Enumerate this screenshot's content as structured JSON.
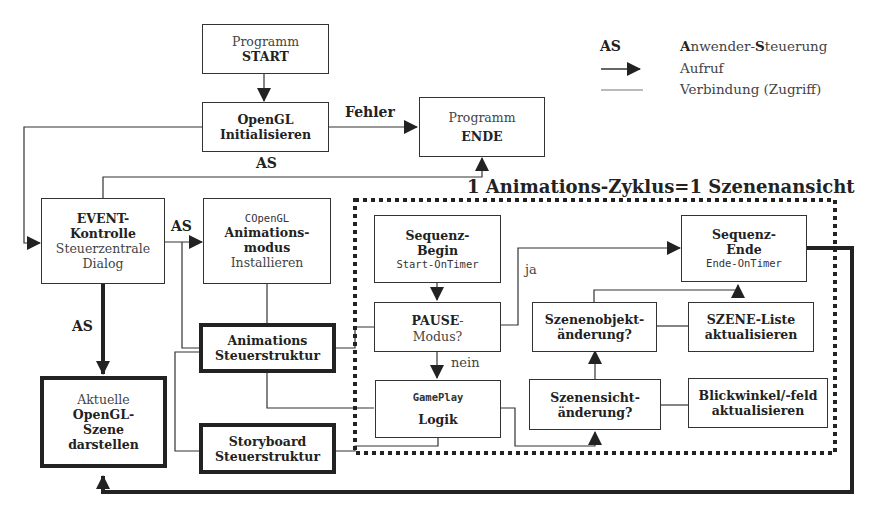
{
  "legend": {
    "as_key": "AS",
    "as_text_a": "A",
    "as_text_mid": "nwender-",
    "as_text_s": "S",
    "as_text_rest": "teuerung",
    "arrow_text": "Aufruf",
    "line_text": "Verbindung (Zugriff)"
  },
  "cycle_title": "1 Animations-Zyklus=1 Szenenansicht",
  "boxes": {
    "start": {
      "line1": "Programm",
      "line2": "START"
    },
    "init": {
      "line1": "OpenGL",
      "line2": "Initialisieren"
    },
    "ende": {
      "line1": "Programm",
      "line2": "ENDE"
    },
    "event": {
      "line1": "EVENT-",
      "line2": "Kontrolle",
      "line3": "Steuerzentrale",
      "line4": "Dialog"
    },
    "animmodus": {
      "line1": "COpenGL",
      "line2": "Animations-",
      "line3": "modus",
      "line4": "Installieren"
    },
    "animsteuer": {
      "line1": "Animations",
      "line2": "Steuerstruktur"
    },
    "storyboard": {
      "line1": "Storyboard",
      "line2": "Steuerstruktur"
    },
    "szene": {
      "line1": "Aktuelle",
      "line2": "OpenGL-",
      "line3": "Szene",
      "line4": "darstellen"
    },
    "seqbegin": {
      "line1": "Sequenz-",
      "line2": "Begin",
      "line3": "Start-OnTimer"
    },
    "pause": {
      "line1": "PAUSE",
      "line2": "-",
      "line3": "Modus?"
    },
    "gameplay": {
      "line1": "GamePlay",
      "line2": "Logik"
    },
    "seqende": {
      "line1": "Sequenz-",
      "line2": "Ende",
      "line3": "Ende-OnTimer"
    },
    "objaend": {
      "line1": "Szenenobjekt-",
      "line2": "änderung?"
    },
    "szeneliste": {
      "line1": "SZENE-Liste",
      "line2": "aktualisieren"
    },
    "sichtaend": {
      "line1": "Szenensicht-",
      "line2": "änderung?"
    },
    "blick": {
      "line1": "Blickwinkel/-feld",
      "line2": "aktualisieren"
    }
  },
  "labels": {
    "fehler": "Fehler",
    "as_top": "AS",
    "as_event_anim": "AS",
    "as_event_szene": "AS",
    "ja": "ja",
    "nein": "nein"
  }
}
